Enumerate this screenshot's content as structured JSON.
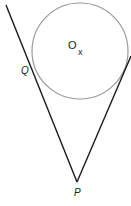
{
  "diagram": {
    "type": "geometry",
    "colors": {
      "circle": "#999999",
      "lines": "#1a1a1a",
      "text": "#222222",
      "background": "#ffffff"
    },
    "circle": {
      "cx": 80,
      "cy": 51,
      "r": 48,
      "center_label": "O",
      "center_mark": "x"
    },
    "points": {
      "P": {
        "label": "P",
        "x": 77,
        "y": 182
      },
      "Q": {
        "label": "Q",
        "x": 34,
        "y": 69
      }
    },
    "tangent_left": {
      "x1": 6,
      "y1": 5,
      "x2": 77,
      "y2": 182
    },
    "tangent_right": {
      "x1": 77,
      "y1": 182,
      "x2": 131,
      "y2": 56
    }
  }
}
